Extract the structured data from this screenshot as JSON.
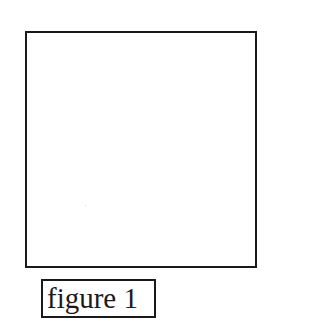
{
  "figure": {
    "caption": "figure 1",
    "frame_color": "#1a1a1a",
    "background": "#ffffff"
  }
}
